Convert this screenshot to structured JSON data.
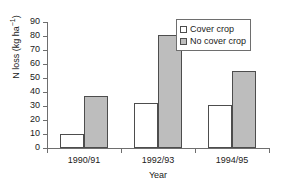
{
  "chart_data": {
    "type": "bar",
    "title": "",
    "xlabel": "Year",
    "ylabel": "N loss (kg ha-1)",
    "ylabel_base": "N loss (kg ha",
    "ylabel_sup": "−1",
    "ylabel_close": ")",
    "categories": [
      "1990/91",
      "1992/93",
      "1994/95"
    ],
    "series": [
      {
        "name": "Cover crop",
        "values": [
          10,
          32,
          31
        ],
        "color": "#ffffff"
      },
      {
        "name": "No cover crop",
        "values": [
          37,
          81,
          55
        ],
        "color": "#bdbdbd"
      }
    ],
    "ylim": [
      0,
      90
    ],
    "ytick_labels": [
      "90",
      "80",
      "70",
      "60",
      "50",
      "40",
      "30",
      "20",
      "10",
      "0"
    ],
    "ytick_values": [
      90,
      80,
      70,
      60,
      50,
      40,
      30,
      20,
      10,
      0
    ],
    "grid": false,
    "legend_position": "top-right",
    "legend_entries": [
      "Cover crop",
      "No cover crop"
    ],
    "axis_color": "#6e6e6e",
    "bar_edge_color": "#4d4d4d"
  }
}
